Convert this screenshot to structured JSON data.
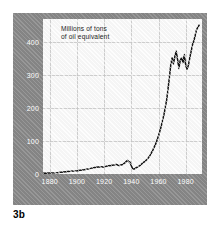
{
  "figure": {
    "caption": "3b",
    "axis_title": "Millions of tons\nof oil equivalent"
  },
  "chart_data": {
    "type": "line",
    "title": "",
    "subtitle": "",
    "xlabel": "",
    "ylabel": "Millions of tons of oil equivalent",
    "xlim": [
      1875,
      1992
    ],
    "ylim": [
      0,
      470
    ],
    "grid": true,
    "legend": false,
    "yticks": [
      0,
      100,
      200,
      300,
      400
    ],
    "ytick_labels": [
      "0",
      "100",
      "200",
      "300",
      "400"
    ],
    "xticks": [
      1880,
      1900,
      1920,
      1940,
      1960,
      1980
    ],
    "xtick_labels": [
      "1880",
      "1900",
      "1920",
      "1940",
      "1960",
      "1980"
    ],
    "line_color": "#141414",
    "series": [
      {
        "name": "Oil equivalent consumption",
        "x": [
          1875,
          1880,
          1885,
          1890,
          1895,
          1900,
          1905,
          1910,
          1913,
          1917,
          1920,
          1922,
          1925,
          1927,
          1929,
          1931,
          1933,
          1935,
          1937,
          1938,
          1939,
          1940,
          1941,
          1942,
          1943,
          1945,
          1947,
          1948,
          1950,
          1952,
          1954,
          1956,
          1958,
          1960,
          1962,
          1964,
          1966,
          1967,
          1968,
          1969,
          1970,
          1971,
          1972,
          1973,
          1974,
          1975,
          1976,
          1977,
          1978,
          1979,
          1980,
          1981,
          1982,
          1983,
          1984,
          1985,
          1986,
          1987,
          1988,
          1990
        ],
        "y": [
          2,
          3,
          4,
          6,
          8,
          10,
          13,
          17,
          20,
          22,
          21,
          24,
          26,
          27,
          29,
          26,
          28,
          33,
          41,
          38,
          36,
          25,
          16,
          15,
          18,
          22,
          28,
          32,
          38,
          46,
          58,
          74,
          92,
          116,
          145,
          180,
          225,
          258,
          292,
          330,
          352,
          334,
          356,
          372,
          348,
          320,
          345,
          352,
          338,
          362,
          330,
          318,
          330,
          352,
          372,
          392,
          404,
          420,
          438,
          452
        ]
      }
    ]
  }
}
